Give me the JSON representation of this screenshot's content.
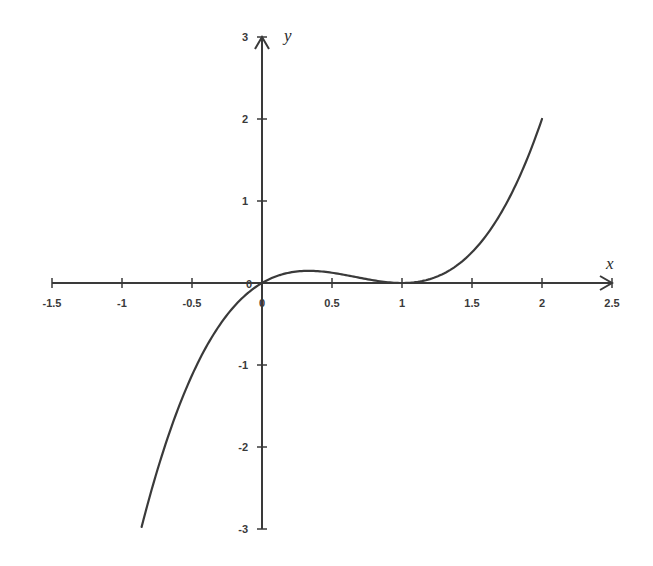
{
  "chart_data": {
    "type": "line",
    "title": "",
    "xlabel": "x",
    "ylabel": "y",
    "xlim": [
      -1.5,
      2.5
    ],
    "ylim": [
      -3,
      3
    ],
    "grid": false,
    "legend": null,
    "x_ticks": [
      "-1.5",
      "-1",
      "-0.5",
      "0",
      "0.5",
      "1",
      "1.5",
      "2",
      "2.5"
    ],
    "y_ticks": [
      "3",
      "2",
      "1",
      "0",
      "-1",
      "-2",
      "-3"
    ],
    "origin_label": "0",
    "function": "y = x(x-1)^2",
    "series": [
      {
        "name": "curve",
        "color": "#3a3a3a",
        "x": [
          -0.86,
          -0.75,
          -0.5,
          -0.25,
          0,
          0.25,
          0.333,
          0.5,
          0.75,
          1,
          1.25,
          1.5,
          1.75,
          2
        ],
        "y": [
          -2.97,
          -2.3,
          -1.125,
          -0.39,
          0,
          0.14,
          0.148,
          0.125,
          0.047,
          0,
          0.078,
          0.375,
          0.98,
          2
        ]
      }
    ]
  }
}
